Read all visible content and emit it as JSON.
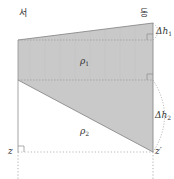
{
  "diagram": {
    "type": "geostrophic-layers-cross-section",
    "colors": {
      "fill": "#c9c9c9",
      "line": "#8a8a8a",
      "dashed": "#9a9a9a",
      "text": "#333333",
      "background": "#ffffff"
    },
    "labels": {
      "west": "서",
      "east": "동",
      "rho1_symbol": "ρ",
      "rho1_sub": "1",
      "rho2_symbol": "ρ",
      "rho2_sub": "2",
      "dh1_symbol": "Δh",
      "dh1_sub": "1",
      "dh2_symbol": "Δh",
      "dh2_sub": "2",
      "z_left": "z",
      "z_right": "z′"
    },
    "regions": [
      {
        "name": "upper-layer",
        "density": "ρ1",
        "shape": "quadrilateral"
      },
      {
        "name": "lower-layer",
        "density": "ρ2",
        "shape": "triangle"
      }
    ]
  }
}
